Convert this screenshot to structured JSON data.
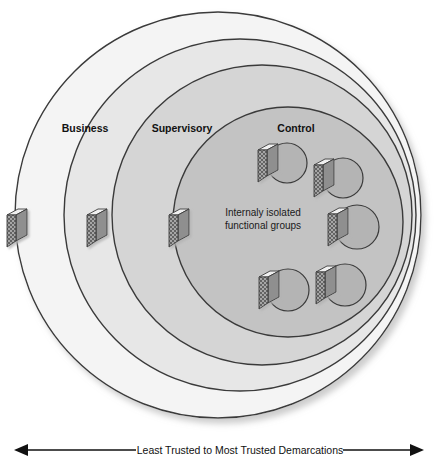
{
  "diagram": {
    "title": "Least Trusted to Most Trusted Demarcations",
    "zones": [
      {
        "id": "business",
        "label": "Business",
        "fill": "#f4f4f4",
        "stroke": "#3a3a3a",
        "cx": 218,
        "cy": 215,
        "r": 203,
        "label_x": 85,
        "label_y": 132
      },
      {
        "id": "supervisory",
        "label": "Supervisory",
        "fill": "#e7e7e7",
        "stroke": "#3a3a3a",
        "cx": 240,
        "cy": 215,
        "r": 176,
        "label_x": 148,
        "label_y": 132
      },
      {
        "id": "control",
        "label": "Control",
        "fill": "#d5d5d5",
        "stroke": "#3a3a3a",
        "cx": 262,
        "cy": 215,
        "r": 150,
        "label_x": 278,
        "label_y": 132
      }
    ],
    "core": {
      "id": "internally-isolated-core",
      "fill": "#c3c3c3",
      "stroke": "#3a3a3a",
      "cx": 288,
      "cy": 222,
      "r": 115,
      "text_line1": "Internaly isolated",
      "text_line2": "functional groups",
      "text_x": 263,
      "text_y1": 216,
      "text_y2": 228
    },
    "functional_groups": [
      {
        "id": "group-1",
        "cx": 287,
        "cy": 163,
        "r": 20
      },
      {
        "id": "group-2",
        "cx": 342,
        "cy": 178,
        "r": 20
      },
      {
        "id": "group-3",
        "cx": 356,
        "cy": 227,
        "r": 22
      },
      {
        "id": "group-4",
        "cx": 287,
        "cy": 289,
        "r": 21
      },
      {
        "id": "group-5",
        "cx": 344,
        "cy": 284,
        "r": 21
      }
    ],
    "boundary_firewalls": [
      {
        "id": "firewall-business-boundary",
        "x": 16,
        "y": 211
      },
      {
        "id": "firewall-supervisory-boundary",
        "x": 96,
        "y": 211
      },
      {
        "id": "firewall-control-boundary",
        "x": 177,
        "y": 211
      }
    ],
    "group_firewalls": [
      {
        "id": "firewall-group-1",
        "x": 256,
        "y": 143
      },
      {
        "id": "firewall-group-2",
        "x": 312,
        "y": 158
      },
      {
        "id": "firewall-group-3",
        "x": 326,
        "y": 207
      },
      {
        "id": "firewall-group-4",
        "x": 256,
        "y": 269
      },
      {
        "id": "firewall-group-5",
        "x": 313,
        "y": 264
      }
    ],
    "axis": {
      "label": "Least Trusted to Most Trusted Demarcations",
      "left_arrow": "◀",
      "right_arrow": "▶",
      "y": 450,
      "x_start": 14,
      "x_end": 424,
      "label_x": 219,
      "label_y": 454
    },
    "colors": {
      "business_fill": "#f4f4f4",
      "supervisory_fill": "#e7e7e7",
      "control_fill": "#d5d5d5",
      "core_fill": "#c3c3c3",
      "group_fill": "#b4b4b4",
      "outline": "#3a3a3a",
      "firewall_face": "#9a9a9a",
      "firewall_top": "#efefef",
      "text": "#111111"
    }
  }
}
